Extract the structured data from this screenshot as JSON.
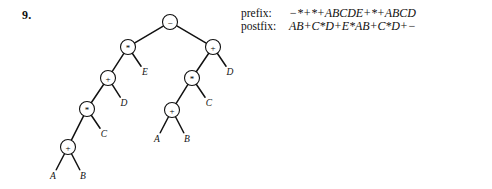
{
  "problem": {
    "number": "9."
  },
  "notation": {
    "rows": [
      {
        "label": "prefix:",
        "value": "−*+*+ABCDE+*+ABCD"
      },
      {
        "label": "postfix:",
        "value": "AB+C*D+E*AB+C*D+−"
      }
    ]
  },
  "tree": {
    "type": "expression-tree",
    "colors": {
      "stroke": "#111111",
      "node_fill": "#ffffff",
      "text": "#111111"
    },
    "node_radius": 7.5,
    "nodes": [
      {
        "id": "root",
        "label": "−",
        "x": 170,
        "y": 22,
        "kind": "operator"
      },
      {
        "id": "l1",
        "label": "*",
        "x": 128,
        "y": 47,
        "kind": "operator"
      },
      {
        "id": "l2",
        "label": "+",
        "x": 108,
        "y": 78,
        "kind": "operator"
      },
      {
        "id": "l3",
        "label": "*",
        "x": 87,
        "y": 109,
        "kind": "operator"
      },
      {
        "id": "l4",
        "label": "+",
        "x": 68,
        "y": 147,
        "kind": "operator"
      },
      {
        "id": "r1",
        "label": "+",
        "x": 213,
        "y": 47,
        "kind": "operator"
      },
      {
        "id": "r2",
        "label": "*",
        "x": 192,
        "y": 78,
        "kind": "operator"
      },
      {
        "id": "r3",
        "label": "+",
        "x": 172,
        "y": 110,
        "kind": "operator"
      }
    ],
    "leaves": [
      {
        "id": "lE",
        "label": "E",
        "x": 145,
        "y": 72,
        "parent": "l1"
      },
      {
        "id": "lD",
        "label": "D",
        "x": 124,
        "y": 103,
        "parent": "l2"
      },
      {
        "id": "lC",
        "label": "C",
        "x": 104,
        "y": 134,
        "parent": "l3"
      },
      {
        "id": "lA",
        "label": "A",
        "x": 53,
        "y": 176,
        "parent": "l4"
      },
      {
        "id": "lB",
        "label": "B",
        "x": 83,
        "y": 176,
        "parent": "l4"
      },
      {
        "id": "rD",
        "label": "D",
        "x": 230,
        "y": 72,
        "parent": "r1"
      },
      {
        "id": "rC",
        "label": "C",
        "x": 209,
        "y": 103,
        "parent": "r2"
      },
      {
        "id": "rA",
        "label": "A",
        "x": 157,
        "y": 139,
        "parent": "r3"
      },
      {
        "id": "rB",
        "label": "B",
        "x": 187,
        "y": 139,
        "parent": "r3"
      }
    ],
    "edges": [
      {
        "from": "root",
        "to": "l1"
      },
      {
        "from": "root",
        "to": "r1"
      },
      {
        "from": "l1",
        "to": "l2"
      },
      {
        "from": "l1",
        "to": "lE"
      },
      {
        "from": "l2",
        "to": "l3"
      },
      {
        "from": "l2",
        "to": "lD"
      },
      {
        "from": "l3",
        "to": "l4"
      },
      {
        "from": "l3",
        "to": "lC"
      },
      {
        "from": "l4",
        "to": "lA"
      },
      {
        "from": "l4",
        "to": "lB"
      },
      {
        "from": "r1",
        "to": "r2"
      },
      {
        "from": "r1",
        "to": "rD"
      },
      {
        "from": "r2",
        "to": "r3"
      },
      {
        "from": "r2",
        "to": "rC"
      },
      {
        "from": "r3",
        "to": "rA"
      },
      {
        "from": "r3",
        "to": "rB"
      }
    ]
  }
}
